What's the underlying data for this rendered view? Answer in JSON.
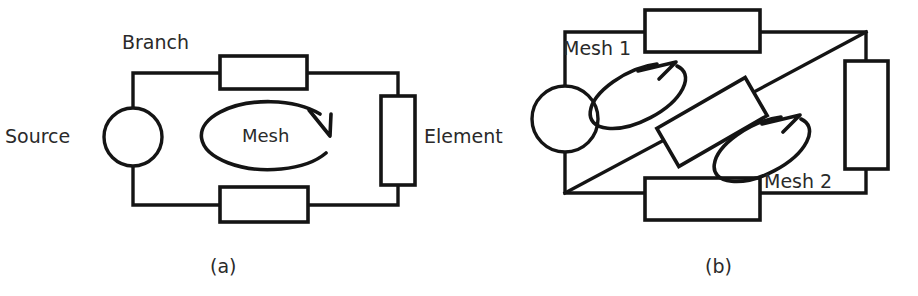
{
  "figure": {
    "kind": "circuit-diagram",
    "background_color": "#ffffff",
    "ink_color": "#141414",
    "text_color": "#2a2a2a",
    "panels": [
      {
        "id": "a",
        "caption": "(a)",
        "labels": {
          "branch": "Branch",
          "source": "Source",
          "element": "Element",
          "mesh": "Mesh"
        },
        "components": [
          "source-circle",
          "top-resistor",
          "right-element",
          "bottom-resistor",
          "mesh-loop-arrow"
        ]
      },
      {
        "id": "b",
        "caption": "(b)",
        "labels": {
          "mesh1": "Mesh 1",
          "mesh2": "Mesh 2"
        },
        "components": [
          "source-circle",
          "top-resistor",
          "right-element",
          "bottom-resistor",
          "diagonal-branch",
          "tilted-resistor",
          "mesh1-loop-arrow",
          "mesh2-loop-arrow"
        ]
      }
    ]
  }
}
